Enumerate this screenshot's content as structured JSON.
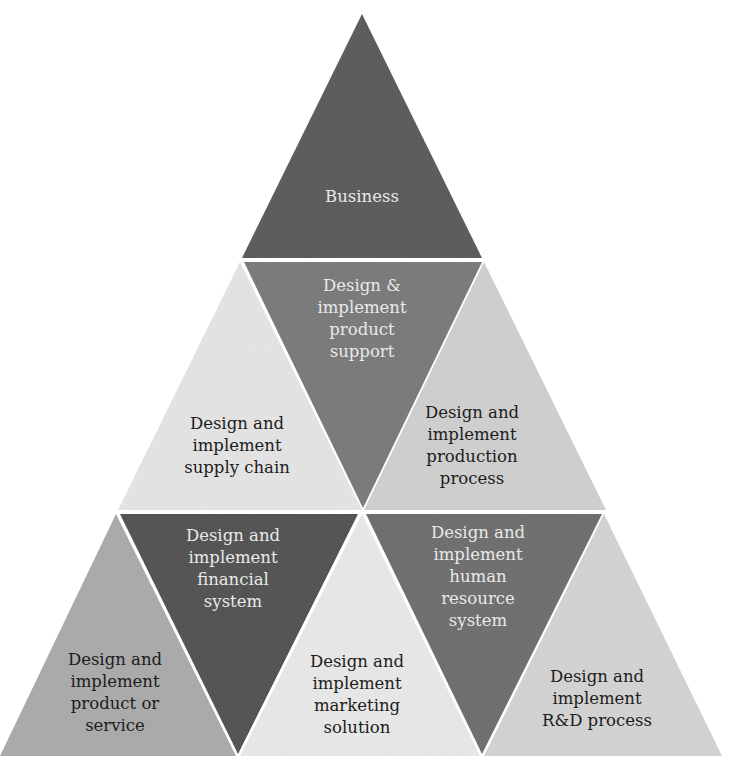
{
  "diagram": {
    "title": "",
    "type": "triangle-pyramid",
    "colors": {
      "background": "#ffffff",
      "separator": "#ffffff"
    },
    "triangles": [
      {
        "id": "business",
        "row": 1,
        "orientation": "up",
        "fill": "#555555",
        "text_color": "#e9e9e9",
        "points": "362,14 242,258 482,258",
        "label_x": 362,
        "label_y": 186,
        "lines": [
          "Business"
        ]
      },
      {
        "id": "supply-chain",
        "row": 2,
        "orientation": "up",
        "fill": "#e4e4e4",
        "text_color": "#1c1c1c",
        "points": "240,262 118,510 362,510",
        "label_x": 237,
        "label_y": 413,
        "lines": [
          "Design and",
          "implement",
          "supply chain"
        ]
      },
      {
        "id": "product-support",
        "row": 2,
        "orientation": "down",
        "fill": "#777777",
        "text_color": "#e9e9e9",
        "points": "244,262 482,262 363,508",
        "label_x": 362,
        "label_y": 275,
        "lines": [
          "Design &",
          "implement",
          "product",
          "support"
        ]
      },
      {
        "id": "production-process",
        "row": 2,
        "orientation": "up",
        "fill": "#cfcfcf",
        "text_color": "#1c1c1c",
        "points": "484,262 364,510 606,510",
        "label_x": 472,
        "label_y": 402,
        "lines": [
          "Design and",
          "implement",
          "production",
          "process"
        ]
      },
      {
        "id": "product-or-service",
        "row": 3,
        "orientation": "up",
        "fill": "#a9a9a9",
        "text_color": "#1c1c1c",
        "points": "116,514 0,756 236,756",
        "label_x": 115,
        "label_y": 649,
        "lines": [
          "Design and",
          "implement",
          "product or",
          "service"
        ]
      },
      {
        "id": "financial-system",
        "row": 3,
        "orientation": "down",
        "fill": "#4b4b4b",
        "text_color": "#e9e9e9",
        "points": "120,514 358,514 238,754",
        "label_x": 233,
        "label_y": 525,
        "lines": [
          "Design and",
          "implement",
          "financial",
          "system"
        ]
      },
      {
        "id": "marketing-solution",
        "row": 3,
        "orientation": "up",
        "fill": "#e8e8e8",
        "text_color": "#1c1c1c",
        "points": "362,514 240,756 480,756",
        "label_x": 357,
        "label_y": 651,
        "lines": [
          "Design and",
          "implement",
          "marketing",
          "solution"
        ]
      },
      {
        "id": "human-resource-system",
        "row": 3,
        "orientation": "down",
        "fill": "#6b6b6b",
        "text_color": "#e9e9e9",
        "points": "366,514 602,514 482,754",
        "label_x": 478,
        "label_y": 522,
        "lines": [
          "Design and",
          "implement",
          "human",
          "resource",
          "system"
        ]
      },
      {
        "id": "rd-process",
        "row": 3,
        "orientation": "up",
        "fill": "#d3d3d3",
        "text_color": "#1c1c1c",
        "points": "604,514 484,756 722,756",
        "label_x": 597,
        "label_y": 666,
        "lines": [
          "Design and",
          "implement",
          "R&D process"
        ]
      }
    ]
  }
}
